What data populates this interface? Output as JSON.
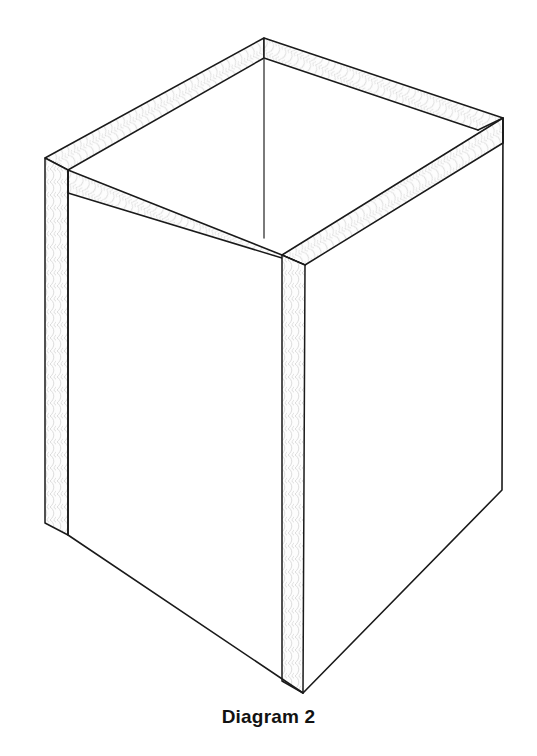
{
  "figure": {
    "caption": "Diagram 2",
    "title": "Diagram 2",
    "view": "isometric three-quarter view from above, open top",
    "colors": {
      "background": "#ffffff",
      "outline": "#1a1a1a",
      "panel_fill": "#ffffff",
      "edge_strip_fill": "#fdfdfd",
      "corrugation": "#d8d8d8",
      "caption_text": "#121212"
    },
    "stroke_widths": {
      "outline": 1.6,
      "inner_edge": 1.3,
      "corrugation": 0.8
    },
    "geometry": {
      "units": "pixels",
      "canvas": {
        "width": 537,
        "height": 756
      },
      "wall_thickness_px": 24,
      "vertices": {
        "top_left_outer": [
          45,
          158
        ],
        "top_rear_outer": [
          264,
          38
        ],
        "top_right_outer": [
          503,
          118
        ],
        "top_front_outer": [
          282,
          255
        ],
        "top_left_inner": [
          68,
          170
        ],
        "top_rear_inner": [
          264,
          58
        ],
        "top_right_inner": [
          478,
          130
        ],
        "top_front_inner": [
          305,
          265
        ],
        "bottom_left_outer": [
          45,
          523
        ],
        "bottom_left_inner": [
          68,
          535
        ],
        "bottom_front": [
          303,
          693
        ],
        "bottom_right": [
          502,
          490
        ]
      },
      "edges": [
        {
          "name": "rear-left-top-rail",
          "from": "top_left_outer",
          "to": "top_rear_outer"
        },
        {
          "name": "rear-right-top-rail",
          "from": "top_rear_outer",
          "to": "top_right_outer"
        },
        {
          "name": "front-left-top-rail",
          "from": "top_left_inner",
          "to": "top_front_outer"
        },
        {
          "name": "front-right-top-rail",
          "from": "top_front_outer",
          "to": "top_right_outer"
        },
        {
          "name": "left-vertical-edge-strip",
          "from": "top_left_outer",
          "to": "bottom_left_outer"
        },
        {
          "name": "front-vertical-edge-strip",
          "from": "top_front_outer",
          "to": "bottom_front"
        },
        {
          "name": "right-vertical-edge",
          "from": "top_right_outer",
          "to": "bottom_right"
        },
        {
          "name": "interior-rear-corner",
          "from": "top_rear_inner",
          "to": [
            264,
            238
          ]
        },
        {
          "name": "bottom-left-edge",
          "from": "bottom_left_inner",
          "to": "bottom_front"
        },
        {
          "name": "bottom-right-edge",
          "from": "bottom_front",
          "to": "bottom_right"
        }
      ],
      "faces": [
        {
          "name": "front-left-panel",
          "visible": true
        },
        {
          "name": "front-right-panel",
          "visible": true
        },
        {
          "name": "interior-rear-left-panel",
          "visible": true
        },
        {
          "name": "interior-rear-right-panel",
          "visible": true
        },
        {
          "name": "top-opening",
          "visible": true,
          "open": true
        }
      ]
    },
    "annotations": {
      "corrugation_hatch": "fine wavy fluting lines shown on all cut cardboard edges",
      "open_top": "box has no lid; interior rear walls visible through opening"
    }
  }
}
